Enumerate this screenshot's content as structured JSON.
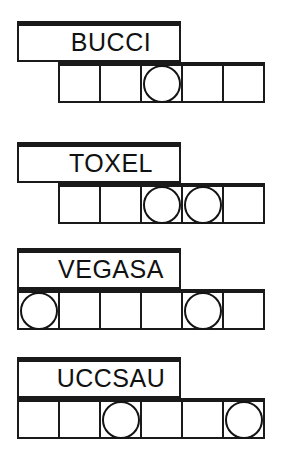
{
  "worksheet": {
    "title": "Word Shape Worksheet",
    "puzzle_count": 4,
    "ink_color": "#1a1a1a",
    "paper_color": "#ffffff",
    "puzzles": [
      {
        "id": "puzzle-1",
        "word": "BUCCI",
        "letter_count": 5,
        "grid_cells": 5,
        "grid_alignment": "right",
        "circled_cells": [
          3
        ],
        "cells": [
          {
            "index": 1,
            "circled": false,
            "letter": ""
          },
          {
            "index": 2,
            "circled": false,
            "letter": ""
          },
          {
            "index": 3,
            "circled": true,
            "letter": ""
          },
          {
            "index": 4,
            "circled": false,
            "letter": ""
          },
          {
            "index": 5,
            "circled": false,
            "letter": ""
          }
        ]
      },
      {
        "id": "puzzle-2",
        "word": "TOXEL",
        "letter_count": 5,
        "grid_cells": 5,
        "grid_alignment": "right",
        "circled_cells": [
          3,
          4
        ],
        "cells": [
          {
            "index": 1,
            "circled": false,
            "letter": ""
          },
          {
            "index": 2,
            "circled": false,
            "letter": ""
          },
          {
            "index": 3,
            "circled": true,
            "letter": ""
          },
          {
            "index": 4,
            "circled": true,
            "letter": ""
          },
          {
            "index": 5,
            "circled": false,
            "letter": ""
          }
        ]
      },
      {
        "id": "puzzle-3",
        "word": "VEGASA",
        "letter_count": 6,
        "grid_cells": 6,
        "grid_alignment": "left",
        "circled_cells": [
          1,
          5
        ],
        "cells": [
          {
            "index": 1,
            "circled": true,
            "letter": ""
          },
          {
            "index": 2,
            "circled": false,
            "letter": ""
          },
          {
            "index": 3,
            "circled": false,
            "letter": ""
          },
          {
            "index": 4,
            "circled": false,
            "letter": ""
          },
          {
            "index": 5,
            "circled": true,
            "letter": ""
          },
          {
            "index": 6,
            "circled": false,
            "letter": ""
          }
        ]
      },
      {
        "id": "puzzle-4",
        "word": "UCCSAU",
        "letter_count": 6,
        "grid_cells": 6,
        "grid_alignment": "left",
        "circled_cells": [
          3,
          6
        ],
        "cells": [
          {
            "index": 1,
            "circled": false,
            "letter": ""
          },
          {
            "index": 2,
            "circled": false,
            "letter": ""
          },
          {
            "index": 3,
            "circled": true,
            "letter": ""
          },
          {
            "index": 4,
            "circled": false,
            "letter": ""
          },
          {
            "index": 5,
            "circled": false,
            "letter": ""
          },
          {
            "index": 6,
            "circled": true,
            "letter": ""
          }
        ]
      }
    ]
  }
}
